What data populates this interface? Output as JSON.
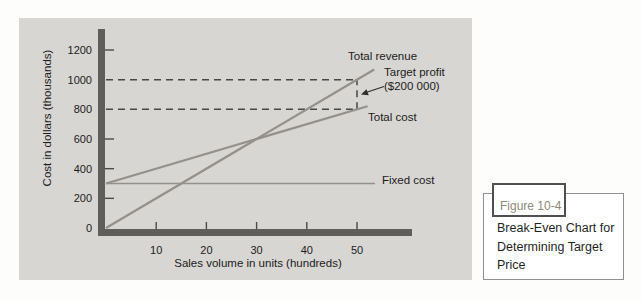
{
  "figure": {
    "label": "Figure 10-4",
    "caption": "Break-Even Chart for Determining Target Price"
  },
  "colors": {
    "chart_line": "#95908a",
    "axis_bar": "#5e5e5c",
    "dashed_guide": "#474747",
    "panel_bg": "#d7d6d3",
    "tick_text": "#1c1c1c",
    "figure_label_text": "#8f897a"
  },
  "chart_data": {
    "type": "line",
    "title": "",
    "xlabel": "Sales volume in units (hundreds)",
    "ylabel": "Cost in dollars (thousands)",
    "x_ticks": [
      10,
      20,
      30,
      40,
      50
    ],
    "y_ticks": [
      0,
      200,
      400,
      600,
      800,
      1000,
      1200
    ],
    "xlim": [
      0,
      57
    ],
    "ylim": [
      0,
      1350
    ],
    "grid": false,
    "legend": "inline-labels",
    "series": [
      {
        "name": "Total revenue",
        "points": [
          [
            0,
            0
          ],
          [
            50,
            1000
          ]
        ]
      },
      {
        "name": "Total cost",
        "points": [
          [
            0,
            300
          ],
          [
            50,
            800
          ]
        ]
      },
      {
        "name": "Fixed cost",
        "points": [
          [
            0,
            300
          ],
          [
            50,
            300
          ]
        ]
      }
    ],
    "series_labels": {
      "total_revenue": "Total revenue",
      "total_cost": "Total cost",
      "fixed_cost": "Fixed cost"
    },
    "annotations": {
      "dashed_guides": [
        {
          "orient": "h",
          "y": 1000,
          "x_from": 0,
          "x_to": 50
        },
        {
          "orient": "h",
          "y": 800,
          "x_from": 0,
          "x_to": 50
        },
        {
          "orient": "v",
          "x": 50,
          "y_from": 800,
          "y_to": 1000
        }
      ],
      "target_profit": {
        "line1": "Target profit",
        "line2": "($200 000)",
        "at_units": 50,
        "between_y": [
          800,
          1000
        ]
      }
    }
  }
}
